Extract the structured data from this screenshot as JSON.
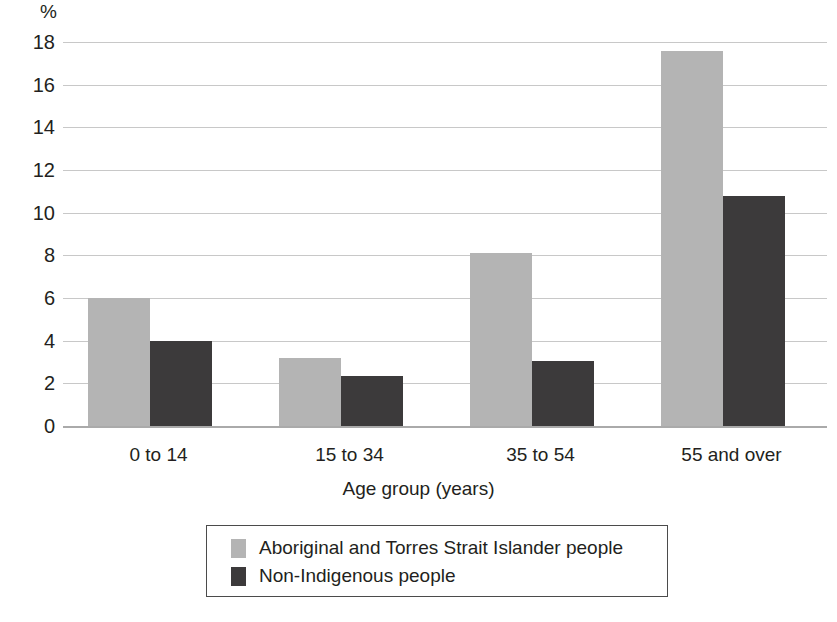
{
  "chart_data": {
    "type": "bar",
    "title": "",
    "subtitle": "",
    "xlabel": "Age group (years)",
    "ylabel": "%",
    "y_unit_label": "%",
    "categories": [
      "0 to 14",
      "15 to 34",
      "35 to 54",
      "55 and over"
    ],
    "series": [
      {
        "name": "Aboriginal and Torres Strait Islander people",
        "color": "#b4b4b4",
        "values": [
          6.0,
          3.2,
          8.1,
          17.6
        ]
      },
      {
        "name": "Non-Indigenous people",
        "color": "#3c3a3b",
        "values": [
          4.0,
          2.35,
          3.05,
          10.8
        ]
      }
    ],
    "ylim": [
      0,
      18
    ],
    "y_ticks": [
      0,
      2,
      4,
      6,
      8,
      10,
      12,
      14,
      16,
      18
    ],
    "y_tick_labels": [
      "0",
      "2",
      "4",
      "6",
      "8",
      "10",
      "12",
      "14",
      "16",
      "18"
    ],
    "grid": true,
    "grid_axis": "y",
    "legend_position": "bottom-center",
    "legend_entries": [
      {
        "label": "Aboriginal and Torres Strait Islander people",
        "swatch": "#b4b4b4"
      },
      {
        "label": "Non-Indigenous people",
        "swatch": "#3c3a3b"
      }
    ]
  }
}
